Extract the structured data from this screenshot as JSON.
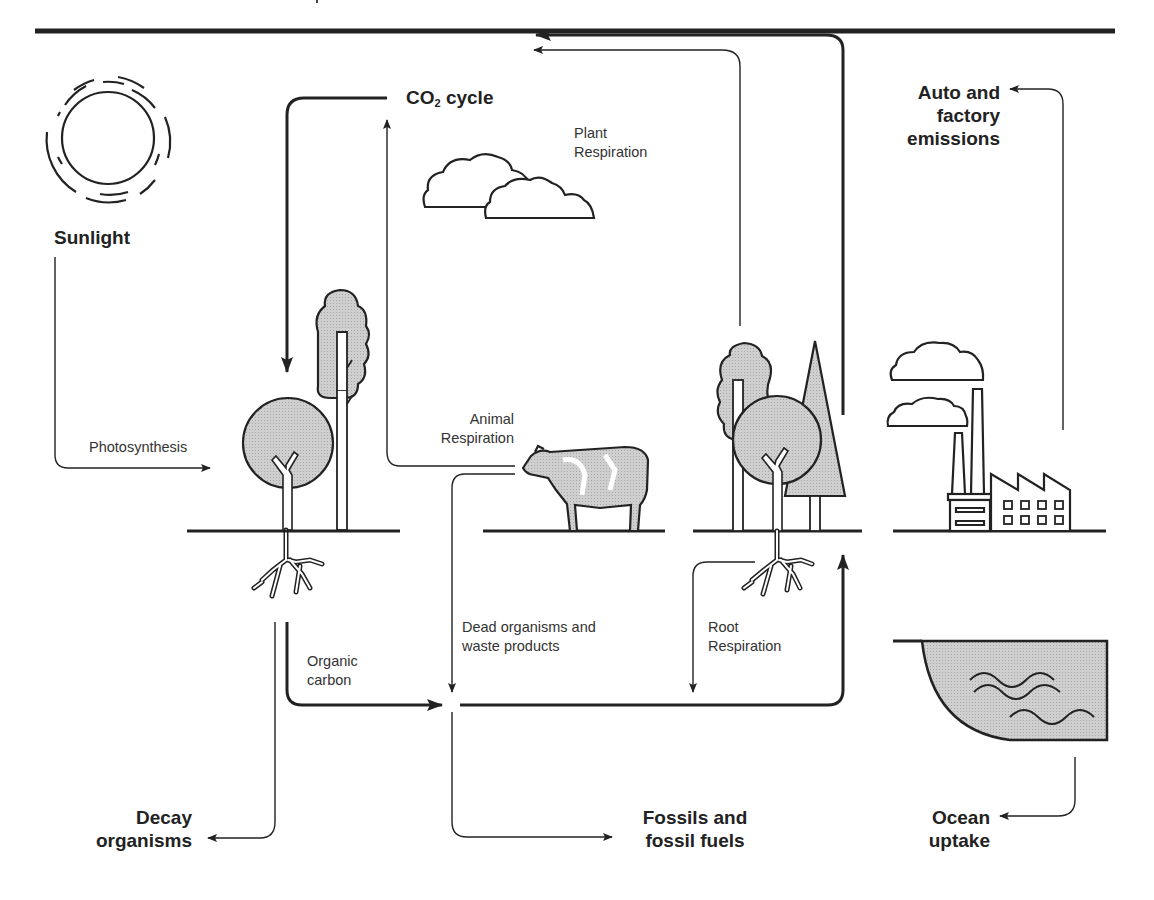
{
  "diagram": {
    "type": "carbon-cycle",
    "colors": {
      "line": "#222222",
      "fill_gray": "#c8c8c8",
      "background": "#ffffff"
    },
    "nodes": {
      "sunlight": "Sunlight",
      "co2_cycle": {
        "prefix": "CO",
        "subscript": "2",
        "suffix": " cycle"
      },
      "auto_factory": [
        "Auto and",
        "factory",
        "emissions"
      ],
      "decay": [
        "Decay",
        "organisms"
      ],
      "fossils": [
        "Fossils and",
        "fossil fuels"
      ],
      "ocean": [
        "Ocean",
        "uptake"
      ]
    },
    "flows": {
      "photosynthesis": "Photosynthesis",
      "plant_respiration": [
        "Plant",
        "Respiration"
      ],
      "animal_respiration": [
        "Animal",
        "Respiration"
      ],
      "organic_carbon": [
        "Organic",
        "carbon"
      ],
      "dead_organisms": [
        "Dead organisms and",
        "waste products"
      ],
      "root_respiration": [
        "Root",
        "Respiration"
      ]
    },
    "icons": [
      "sun-icon",
      "cloud-icon",
      "tree-icon",
      "cow-icon",
      "factory-icon",
      "ocean-icon"
    ]
  }
}
